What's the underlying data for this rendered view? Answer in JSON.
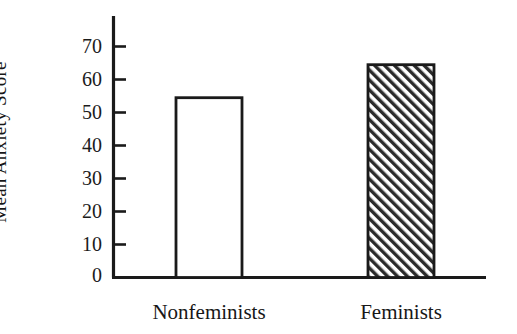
{
  "chart_data": {
    "type": "bar",
    "title": "",
    "subtitle": "",
    "xlabel": "",
    "ylabel": "Mean Anxiety Score",
    "categories": [
      "Nonfeminists",
      "Feminists"
    ],
    "values": [
      54.5,
      64.5
    ],
    "series": [
      {
        "name": "Mean Anxiety Score",
        "values": [
          54.5,
          64.5
        ]
      }
    ],
    "ylim": [
      0,
      78
    ],
    "yticks": [
      0,
      10,
      20,
      30,
      40,
      50,
      60,
      70
    ],
    "ytick_labels": [
      "0",
      "10",
      "20",
      "30",
      "40",
      "50",
      "60",
      "70"
    ],
    "grid": false,
    "legend": false,
    "legend_position": "none",
    "bar_styles": [
      {
        "category": "Nonfeminists",
        "fill": "none",
        "pattern": "open",
        "edge_color": "#1a1a1a"
      },
      {
        "category": "Feminists",
        "fill": "hatch",
        "pattern": "diagonal-forward-hatch",
        "edge_color": "#1a1a1a"
      }
    ],
    "annotations": [],
    "colors": {
      "background": "#ffffff",
      "axis": "#1a1a1a",
      "text": "#1a1a1a",
      "bar_open_fill": "#ffffff",
      "bar_hatch_line": "#242424"
    }
  },
  "axes": {
    "y_title": "Mean Anxiety Score",
    "ticks": [
      {
        "value": 70,
        "label": "70"
      },
      {
        "value": 60,
        "label": "60"
      },
      {
        "value": 50,
        "label": "50"
      },
      {
        "value": 40,
        "label": "40"
      },
      {
        "value": 30,
        "label": "30"
      },
      {
        "value": 20,
        "label": "20"
      },
      {
        "value": 10,
        "label": "10"
      },
      {
        "value": 0,
        "label": "0"
      }
    ]
  },
  "x_labels": [
    {
      "label": "Nonfeminists"
    },
    {
      "label": "Feminists"
    }
  ]
}
